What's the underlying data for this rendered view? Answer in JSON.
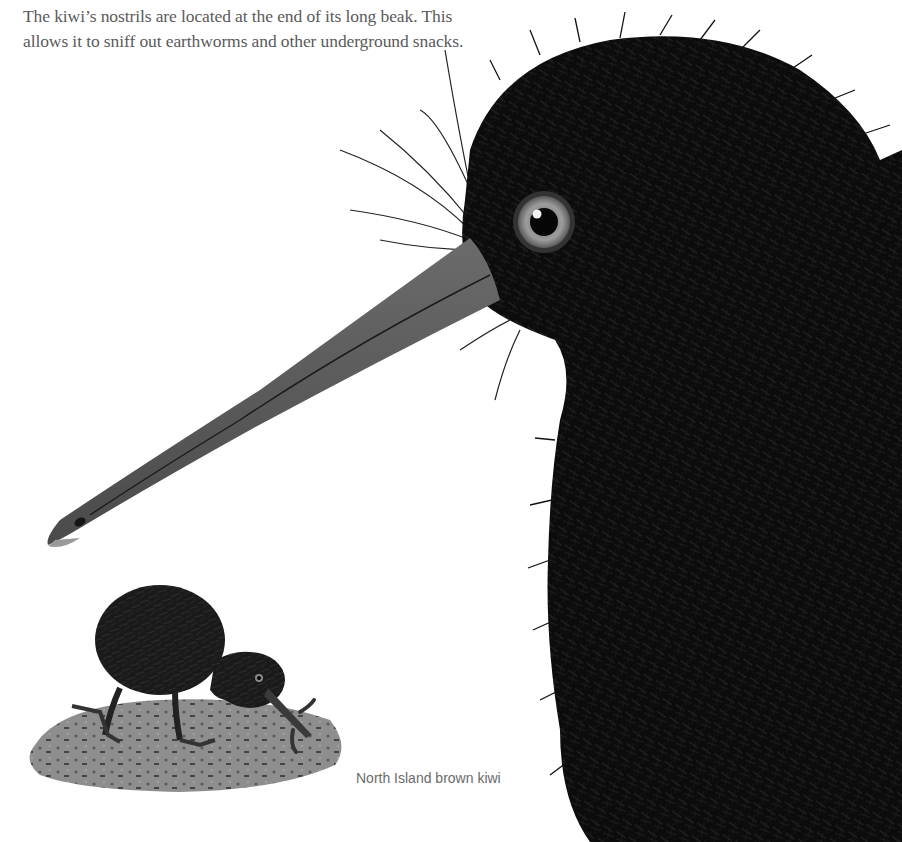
{
  "page": {
    "intro_text": "The kiwi’s nostrils are located at the end of its long beak. This allows it to sniff out earthworms and other underground snacks.",
    "caption": "North Island brown kiwi"
  },
  "illustrations": {
    "large_kiwi": {
      "subject": "kiwi-head-closeup",
      "colors": {
        "feathers": "#0d0d0d",
        "beak": "#5c5c5c",
        "beak_tip": "#9a9a9a",
        "eye_iris": "#8a8a8a",
        "pupil": "#050505"
      }
    },
    "small_kiwi": {
      "subject": "kiwi-foraging-full-body",
      "colors": {
        "feathers": "#1a1a1a",
        "ground": "#8c8c8c",
        "worm": "#3a3a3a"
      }
    }
  }
}
